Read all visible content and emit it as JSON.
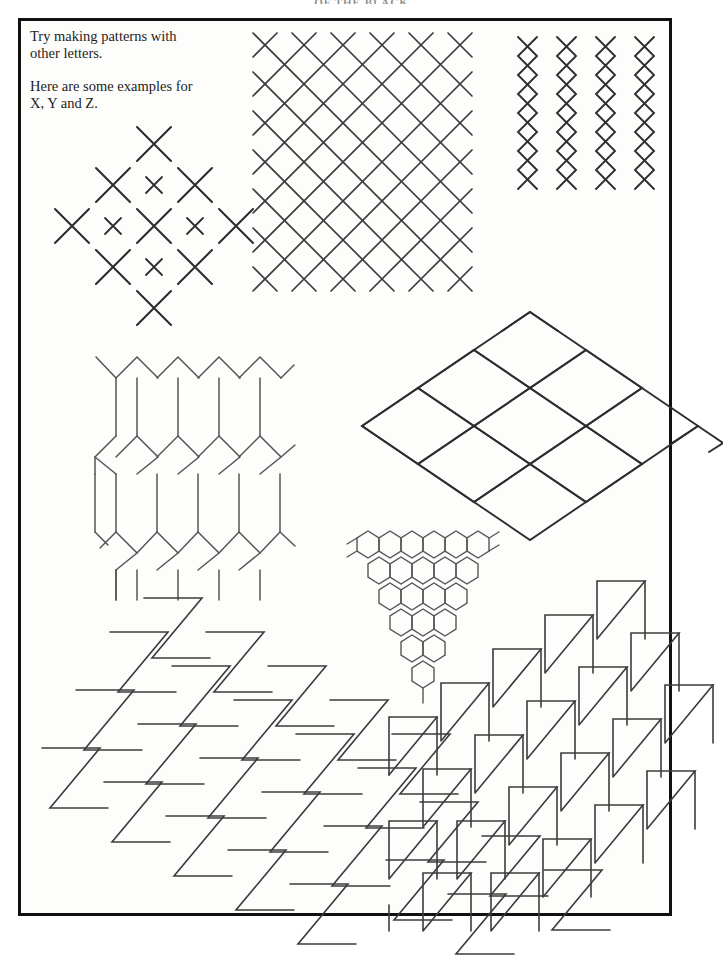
{
  "page": {
    "running_header": "OF THE BLACK",
    "background_color": "#fdfdfb",
    "frame_color": "#111111",
    "ink_color": "#3c3c3c"
  },
  "instructions": {
    "line_1": "Try making patterns with\nother letters.",
    "line_2": "Here are some examples for\nX, Y and Z."
  },
  "patterns": [
    {
      "id": "x-diamond-cluster",
      "letter": "X",
      "name": "Diamond cluster of X shapes",
      "description": "Large X letters arranged on the outline of a diamond with smaller X letters filling the interior lattice points."
    },
    {
      "id": "x-dense-lattice",
      "letter": "X",
      "name": "Dense diagonal X lattice",
      "description": "Tightly tessellated X letters whose arms join to form a continuous diamond grid."
    },
    {
      "id": "x-vertical-chains",
      "letter": "X",
      "name": "Vertical X chains",
      "description": "Four vertical columns of stacked X letters forming narrow chain ribbons."
    },
    {
      "id": "y-hex-mesh",
      "letter": "Y",
      "name": "Elongated hexagon mesh",
      "description": "Y letters joined stem to stem producing a chicken-wire mesh of tall hexagons."
    },
    {
      "id": "y-diamond-field",
      "letter": "Y",
      "name": "Horizontal diamond field",
      "description": "Y letters tiled into a wide rhombic field that bleeds past the right hand rule of the frame."
    },
    {
      "id": "y-honeycomb-triangle",
      "letter": "Y",
      "name": "Triangular honeycomb",
      "description": "Small hexagons built from Y letters stacked into a downward tapering triangle."
    },
    {
      "id": "z-zigzag-tessellation",
      "letter": "Z",
      "name": "Interlocking Z tessellation",
      "description": "Z letters in offset diagonal rows, each Z nesting into the one above it."
    },
    {
      "id": "z-rotated-tessellation",
      "letter": "Z",
      "name": "Rotated Z tessellation",
      "description": "Z letters turned on their side and tiled diagonally, bleeding past the bottom right rule."
    }
  ]
}
